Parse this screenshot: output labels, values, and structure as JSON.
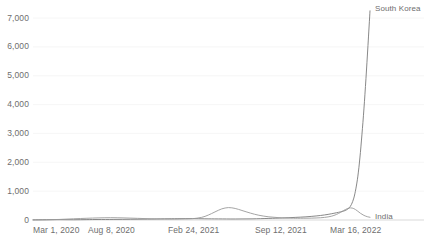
{
  "chart_data": {
    "type": "line",
    "title": "",
    "subtitle": "",
    "xlabel": "",
    "ylabel": "",
    "grid": true,
    "legend_position": "line-end-labels",
    "ylim": [
      0,
      7400
    ],
    "y_ticks": [
      0,
      1000,
      2000,
      3000,
      4000,
      5000,
      6000,
      7000
    ],
    "y_tick_labels": [
      "0",
      "1,000",
      "2,000",
      "3,000",
      "4,000",
      "5,000",
      "6,000",
      "7,000"
    ],
    "x_tick_labels": [
      "Mar 1, 2020",
      "Aug 8, 2020",
      "Feb 24, 2021",
      "Sep 12, 2021",
      "Mar 16, 2022"
    ],
    "x_tick_positions": [
      0,
      0.1925,
      0.4725,
      0.7775,
      1.0
    ],
    "x_range_start": "Mar 1, 2020",
    "x_range_end": "Mar 16, 2022",
    "series": [
      {
        "name": "South Korea",
        "color": "#7a7a7a",
        "label_x": 1.0,
        "label_y": 7400,
        "x": [
          0.0,
          0.04,
          0.08,
          0.12,
          0.16,
          0.193,
          0.24,
          0.29,
          0.34,
          0.39,
          0.43,
          0.473,
          0.51,
          0.55,
          0.6,
          0.65,
          0.7,
          0.74,
          0.778,
          0.81,
          0.84,
          0.865,
          0.885,
          0.9,
          0.912,
          0.922,
          0.93,
          0.938,
          0.945,
          0.952,
          0.958,
          0.964,
          0.97,
          0.976,
          0.982,
          0.988,
          0.994,
          1.0
        ],
        "y": [
          5,
          10,
          12,
          9,
          14,
          18,
          20,
          25,
          30,
          40,
          45,
          48,
          42,
          38,
          35,
          40,
          55,
          70,
          90,
          110,
          140,
          175,
          215,
          250,
          280,
          310,
          350,
          420,
          540,
          760,
          1080,
          1520,
          2150,
          2950,
          3850,
          4900,
          6050,
          7250
        ]
      },
      {
        "name": "India",
        "color": "#9a9a9a",
        "label_x": 1.0,
        "label_y": 150,
        "x": [
          0.0,
          0.04,
          0.08,
          0.12,
          0.16,
          0.193,
          0.23,
          0.27,
          0.31,
          0.35,
          0.39,
          0.42,
          0.45,
          0.473,
          0.5,
          0.52,
          0.54,
          0.56,
          0.58,
          0.6,
          0.62,
          0.645,
          0.67,
          0.7,
          0.73,
          0.76,
          0.778,
          0.81,
          0.84,
          0.865,
          0.885,
          0.9,
          0.912,
          0.922,
          0.932,
          0.942,
          0.952,
          0.962,
          0.972,
          0.982,
          0.992,
          1.0
        ],
        "y": [
          2,
          6,
          20,
          42,
          60,
          72,
          80,
          72,
          58,
          42,
          35,
          32,
          38,
          45,
          90,
          170,
          280,
          385,
          430,
          400,
          330,
          240,
          165,
          110,
          80,
          65,
          60,
          62,
          70,
          90,
          130,
          190,
          260,
          330,
          390,
          420,
          395,
          320,
          230,
          160,
          115,
          95
        ]
      }
    ]
  },
  "axis": {
    "baseline_label": "0"
  }
}
